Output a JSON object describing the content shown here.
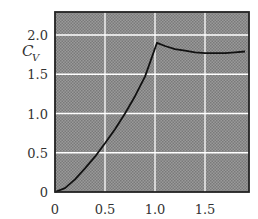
{
  "chart_data": {
    "type": "line",
    "title": "",
    "xlabel": "",
    "ylabel": "C_V",
    "ylabel_main": "C",
    "ylabel_sub": "V",
    "xlim": [
      0,
      1.93
    ],
    "ylim": [
      0,
      2.28
    ],
    "grid": true,
    "x_ticks": [
      "0",
      "0.5",
      "1.0",
      "1.5"
    ],
    "y_ticks": [
      "0",
      "0.5",
      "1.0",
      "1.5",
      "2.0"
    ],
    "series": [
      {
        "name": "C_V",
        "x": [
          0,
          0.1,
          0.2,
          0.3,
          0.4,
          0.5,
          0.6,
          0.7,
          0.8,
          0.9,
          1.02,
          1.1,
          1.2,
          1.3,
          1.4,
          1.5,
          1.6,
          1.7,
          1.8,
          1.9
        ],
        "y": [
          0,
          0.05,
          0.16,
          0.3,
          0.45,
          0.62,
          0.8,
          1.0,
          1.22,
          1.47,
          1.9,
          1.86,
          1.82,
          1.8,
          1.78,
          1.77,
          1.77,
          1.77,
          1.78,
          1.79
        ]
      }
    ],
    "legend": null,
    "colors": {
      "plot_background": "#8c8c8c",
      "grid": "#ffffff",
      "line": "#111111",
      "frame": "#222222"
    }
  }
}
